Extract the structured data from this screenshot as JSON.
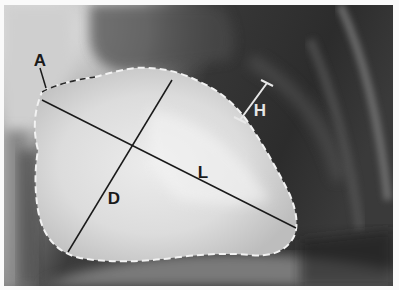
{
  "figure": {
    "labels": {
      "a": "A",
      "h": "H",
      "l": "L",
      "d": "D"
    },
    "colors": {
      "outline": "#f2f2f2",
      "measure_lines": "#1a1a1a",
      "h_bar": "#e8e8e8",
      "frame_border": "#fafafa"
    }
  }
}
